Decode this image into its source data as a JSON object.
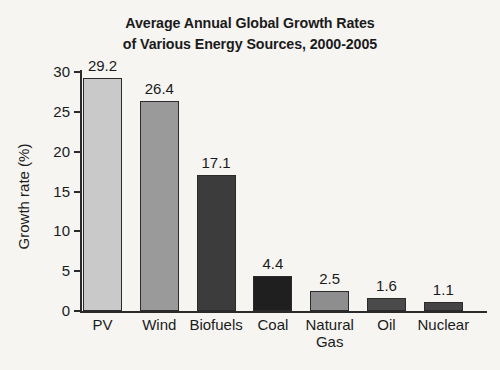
{
  "title": {
    "line1": "Average Annual Global Growth Rates",
    "line2": "of Various Energy Sources, 2000-2005"
  },
  "axes": {
    "ylabel": "Growth rate (%)",
    "xlabel": "",
    "yticks": [
      "0",
      "5",
      "10",
      "15",
      "20",
      "25",
      "30"
    ]
  },
  "chart_data": {
    "type": "bar",
    "title": "Average Annual Global Growth Rates of Various Energy Sources, 2000-2005",
    "xlabel": "",
    "ylabel": "Growth rate (%)",
    "ylim": [
      0,
      30
    ],
    "yticks": [
      0,
      5,
      10,
      15,
      20,
      25,
      30
    ],
    "grid": false,
    "legend": "none",
    "categories": [
      "PV",
      "Wind",
      "Biofuels",
      "Coal",
      "Natural Gas",
      "Oil",
      "Nuclear"
    ],
    "values": [
      29.2,
      26.4,
      17.1,
      4.4,
      2.5,
      1.6,
      1.1
    ],
    "value_labels": [
      "29.2",
      "26.4",
      "17.1",
      "4.4",
      "2.5",
      "1.6",
      "1.1"
    ],
    "bar_colors": [
      "#c9c9c9",
      "#9a9a9a",
      "#3c3c3c",
      "#1f1f1f",
      "#8e8e8e",
      "#4a4a4a",
      "#444444"
    ],
    "bar_edge_color": "#2b2b2b",
    "background_color": "#f6f5f2",
    "text_color": "#1b1b1b"
  },
  "bars": [
    {
      "label": "PV",
      "label_line2": "",
      "value_label": "29.2",
      "value": 29.2,
      "color": "#c9c9c9"
    },
    {
      "label": "Wind",
      "label_line2": "",
      "value_label": "26.4",
      "value": 26.4,
      "color": "#9a9a9a"
    },
    {
      "label": "Biofuels",
      "label_line2": "",
      "value_label": "17.1",
      "value": 17.1,
      "color": "#3c3c3c"
    },
    {
      "label": "Coal",
      "label_line2": "",
      "value_label": "4.4",
      "value": 4.4,
      "color": "#1f1f1f"
    },
    {
      "label": "Natural",
      "label_line2": "Gas",
      "value_label": "2.5",
      "value": 2.5,
      "color": "#8e8e8e"
    },
    {
      "label": "Oil",
      "label_line2": "",
      "value_label": "1.6",
      "value": 1.6,
      "color": "#4a4a4a"
    },
    {
      "label": "Nuclear",
      "label_line2": "",
      "value_label": "1.1",
      "value": 1.1,
      "color": "#444444"
    }
  ]
}
